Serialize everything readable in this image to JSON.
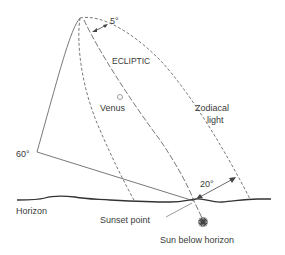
{
  "diagram": {
    "labels": {
      "five_deg": "5°",
      "ecliptic": "ECLIPTIC",
      "venus": "Venus",
      "zodiacal_line1": "Zodiacal",
      "zodiacal_line2": "light",
      "sixty_deg": "60°",
      "twenty_deg": "20°",
      "horizon": "Horizon",
      "sunset_point": "Sunset point",
      "sun_below": "Sun below horizon"
    },
    "colors": {
      "line": "#555555",
      "horizon": "#333333",
      "text": "#3a3a3a",
      "sun": "#444444"
    }
  }
}
